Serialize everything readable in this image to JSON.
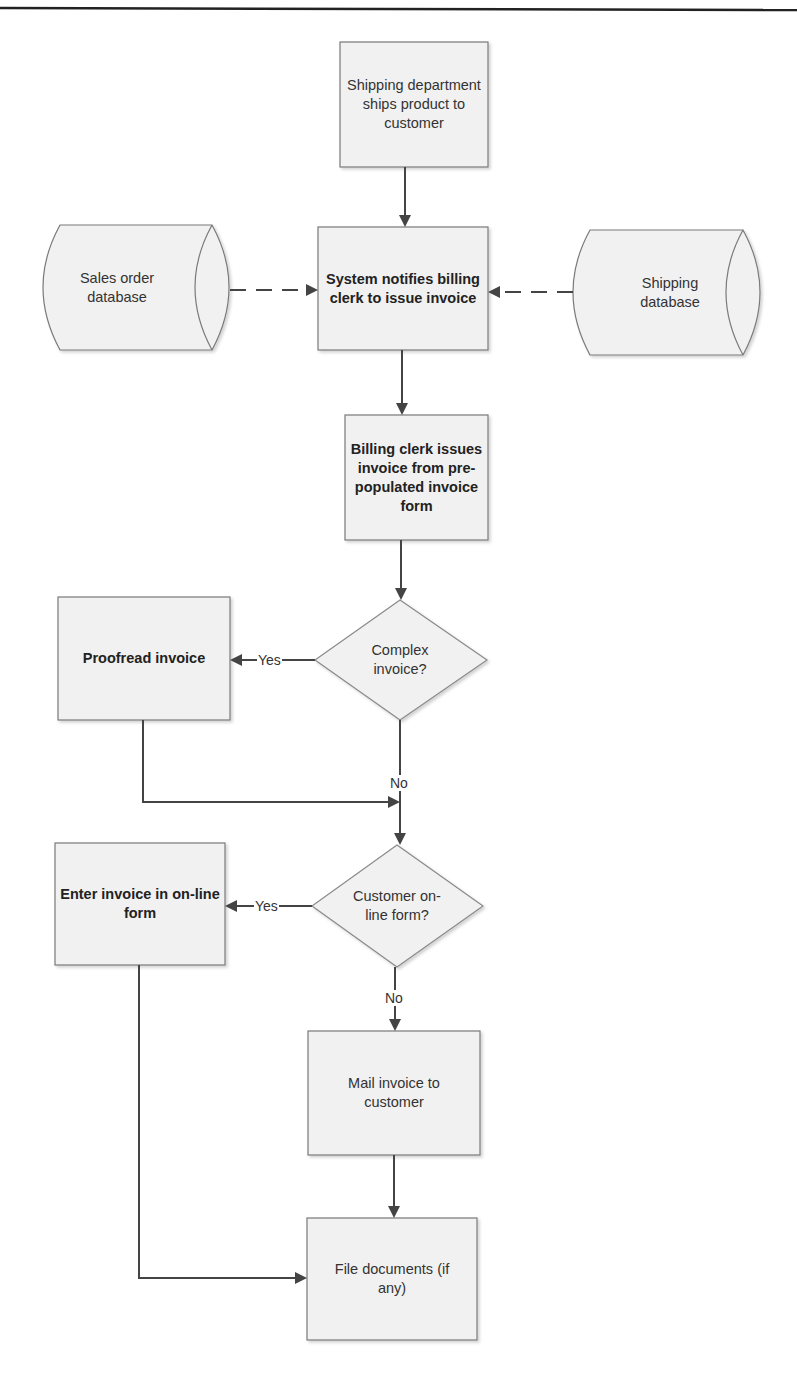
{
  "diagram": {
    "type": "flowchart",
    "nodes": {
      "ship_product": {
        "label": "Shipping department ships product to customer",
        "shape": "process",
        "bold": false
      },
      "sales_db": {
        "label": "Sales order database",
        "shape": "database",
        "bold": false
      },
      "system_notify": {
        "label": "System notifies billing clerk to issue invoice",
        "shape": "process",
        "bold": true
      },
      "shipping_db": {
        "label": "Shipping database",
        "shape": "database",
        "bold": false
      },
      "issue_invoice": {
        "label": "Billing clerk issues invoice from  pre-populated invoice form",
        "shape": "process",
        "bold": true
      },
      "complex_decision": {
        "label": "Complex invoice?",
        "shape": "decision",
        "bold": false
      },
      "proofread": {
        "label": "Proofread invoice",
        "shape": "process",
        "bold": true
      },
      "online_decision": {
        "label": "Customer on-line form?",
        "shape": "decision",
        "bold": false
      },
      "enter_online": {
        "label": "Enter invoice in on-line form",
        "shape": "process",
        "bold": true
      },
      "mail_invoice": {
        "label": "Mail invoice to customer",
        "shape": "process",
        "bold": false
      },
      "file_docs": {
        "label": "File documents (if any)",
        "shape": "process",
        "bold": false
      }
    },
    "edges": [
      {
        "from": "ship_product",
        "to": "system_notify",
        "style": "solid",
        "label": ""
      },
      {
        "from": "sales_db",
        "to": "system_notify",
        "style": "dashed",
        "label": ""
      },
      {
        "from": "shipping_db",
        "to": "system_notify",
        "style": "dashed",
        "label": ""
      },
      {
        "from": "system_notify",
        "to": "issue_invoice",
        "style": "solid",
        "label": ""
      },
      {
        "from": "issue_invoice",
        "to": "complex_decision",
        "style": "solid",
        "label": ""
      },
      {
        "from": "complex_decision",
        "to": "proofread",
        "style": "solid",
        "label": "Yes"
      },
      {
        "from": "complex_decision",
        "to": "online_decision",
        "style": "solid",
        "label": "No"
      },
      {
        "from": "proofread",
        "to": "online_decision",
        "style": "solid",
        "label": ""
      },
      {
        "from": "online_decision",
        "to": "enter_online",
        "style": "solid",
        "label": "Yes"
      },
      {
        "from": "online_decision",
        "to": "mail_invoice",
        "style": "solid",
        "label": "No"
      },
      {
        "from": "mail_invoice",
        "to": "file_docs",
        "style": "solid",
        "label": ""
      },
      {
        "from": "enter_online",
        "to": "file_docs",
        "style": "solid",
        "label": ""
      }
    ],
    "edge_labels": {
      "yes1": "Yes",
      "no1": "No",
      "yes2": "Yes",
      "no2": "No"
    },
    "colors": {
      "node_fill": "#f1f1f1",
      "node_stroke": "#7a7a7a",
      "edge": "#444444",
      "text": "#2b2b2b"
    }
  }
}
